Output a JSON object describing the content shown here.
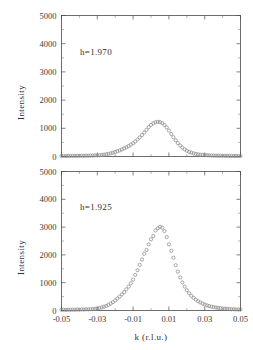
{
  "figure": {
    "name": "two-panel-intensity-scan",
    "background_color": "#ffffff",
    "axis_color": "#4a4a4a",
    "marker_color": "#8c8c8c",
    "text_color": "#2f2f2f"
  },
  "axis_titles": {
    "x": "k  (r.l.u.)",
    "y": "Intensity"
  },
  "chart_data": [
    {
      "type": "scatter",
      "panel": "top",
      "title": "",
      "annotation": "h=1.970",
      "xlabel": "",
      "ylabel": "Intensity",
      "xlim": [
        -0.05,
        0.05
      ],
      "ylim": [
        0,
        5000
      ],
      "xticks": [
        -0.05,
        -0.03,
        -0.01,
        0.01,
        0.03,
        0.05
      ],
      "xticklabels": [
        "-0.05",
        "-0.03",
        "-0.01",
        "0.01",
        "0.03",
        "0.05"
      ],
      "yticks": [
        0,
        1000,
        2000,
        3000,
        4000,
        5000
      ],
      "yticklabels": [
        "0",
        "1000",
        "2000",
        "3000",
        "4000",
        "5000"
      ],
      "grid": false,
      "legend": false,
      "marker": "open-circle",
      "x": [
        -0.05,
        -0.0488,
        -0.0475,
        -0.0463,
        -0.045,
        -0.0438,
        -0.0425,
        -0.0413,
        -0.04,
        -0.0388,
        -0.0375,
        -0.0363,
        -0.035,
        -0.0338,
        -0.0325,
        -0.0313,
        -0.03,
        -0.0288,
        -0.0275,
        -0.0263,
        -0.025,
        -0.0238,
        -0.0225,
        -0.0213,
        -0.02,
        -0.0188,
        -0.0175,
        -0.0163,
        -0.015,
        -0.0138,
        -0.0125,
        -0.0113,
        -0.01,
        -0.0088,
        -0.0075,
        -0.0063,
        -0.005,
        -0.0038,
        -0.0025,
        -0.0013,
        0.0,
        0.0013,
        0.0025,
        0.0038,
        0.005,
        0.0063,
        0.0075,
        0.0088,
        0.01,
        0.0113,
        0.0125,
        0.0138,
        0.015,
        0.0163,
        0.0175,
        0.0188,
        0.02,
        0.0213,
        0.0225,
        0.0238,
        0.025,
        0.0263,
        0.0275,
        0.0288,
        0.03,
        0.0313,
        0.0325,
        0.0338,
        0.035,
        0.0363,
        0.0375,
        0.0388,
        0.04,
        0.0413,
        0.0425,
        0.0438,
        0.045,
        0.0463,
        0.0475,
        0.0488,
        0.05
      ],
      "values": [
        18,
        20,
        16,
        22,
        19,
        24,
        20,
        26,
        22,
        28,
        25,
        30,
        28,
        34,
        32,
        40,
        38,
        48,
        55,
        66,
        78,
        95,
        112,
        135,
        160,
        190,
        215,
        250,
        285,
        325,
        370,
        420,
        470,
        530,
        600,
        675,
        760,
        850,
        945,
        1040,
        1120,
        1180,
        1215,
        1230,
        1220,
        1185,
        1120,
        1030,
        920,
        800,
        685,
        575,
        475,
        390,
        315,
        255,
        205,
        165,
        135,
        110,
        92,
        78,
        66,
        58,
        50,
        45,
        40,
        36,
        33,
        30,
        28,
        26,
        24,
        23,
        22,
        21,
        20,
        19,
        18,
        18,
        17
      ]
    },
    {
      "type": "scatter",
      "panel": "bottom",
      "title": "",
      "annotation": "h=1.925",
      "xlabel": "k  (r.l.u.)",
      "ylabel": "Intensity",
      "xlim": [
        -0.05,
        0.05
      ],
      "ylim": [
        0,
        5000
      ],
      "xticks": [
        -0.05,
        -0.03,
        -0.01,
        0.01,
        0.03,
        0.05
      ],
      "xticklabels": [
        "-0.05",
        "-0.03",
        "-0.01",
        "0.01",
        "0.03",
        "0.05"
      ],
      "yticks": [
        0,
        1000,
        2000,
        3000,
        4000,
        5000
      ],
      "yticklabels": [
        "0",
        "1000",
        "2000",
        "3000",
        "4000",
        "5000"
      ],
      "grid": false,
      "legend": false,
      "marker": "open-circle",
      "x": [
        -0.05,
        -0.0488,
        -0.0475,
        -0.0463,
        -0.045,
        -0.0438,
        -0.0425,
        -0.0413,
        -0.04,
        -0.0388,
        -0.0375,
        -0.0363,
        -0.035,
        -0.0338,
        -0.0325,
        -0.0313,
        -0.03,
        -0.0288,
        -0.0275,
        -0.0263,
        -0.025,
        -0.0238,
        -0.0225,
        -0.0213,
        -0.02,
        -0.0188,
        -0.0175,
        -0.0163,
        -0.015,
        -0.0138,
        -0.0125,
        -0.0113,
        -0.01,
        -0.0088,
        -0.0075,
        -0.0063,
        -0.005,
        -0.0038,
        -0.0025,
        -0.0013,
        0.0,
        0.0013,
        0.0025,
        0.0038,
        0.005,
        0.0063,
        0.0075,
        0.0088,
        0.01,
        0.0113,
        0.0125,
        0.0138,
        0.015,
        0.0163,
        0.0175,
        0.0188,
        0.02,
        0.0213,
        0.0225,
        0.0238,
        0.025,
        0.0263,
        0.0275,
        0.0288,
        0.03,
        0.0313,
        0.0325,
        0.0338,
        0.035,
        0.0363,
        0.0375,
        0.0388,
        0.04,
        0.0413,
        0.0425,
        0.0438,
        0.045,
        0.0463,
        0.0475,
        0.0488,
        0.05
      ],
      "values": [
        22,
        25,
        20,
        28,
        24,
        30,
        26,
        34,
        30,
        38,
        34,
        44,
        40,
        52,
        48,
        62,
        72,
        90,
        110,
        135,
        165,
        200,
        245,
        300,
        360,
        430,
        500,
        580,
        660,
        760,
        860,
        980,
        1110,
        1280,
        1450,
        1640,
        1830,
        2040,
        2180,
        2380,
        2560,
        2680,
        2880,
        2960,
        3010,
        2980,
        2860,
        2640,
        2380,
        2150,
        1900,
        1630,
        1400,
        1190,
        1010,
        860,
        730,
        620,
        530,
        455,
        390,
        335,
        290,
        250,
        215,
        185,
        160,
        140,
        122,
        108,
        95,
        84,
        75,
        67,
        60,
        54,
        48,
        44,
        40,
        36,
        33
      ]
    }
  ]
}
